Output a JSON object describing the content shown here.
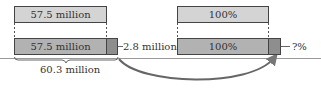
{
  "left": {
    "top_bar": {
      "label": "57.5 million"
    },
    "bottom_bar": {
      "label": "57.5 million"
    },
    "increment": {
      "label": "2.8 million"
    },
    "total": {
      "label": "60.3 million"
    }
  },
  "right": {
    "top_bar": {
      "label": "100%"
    },
    "bottom_bar": {
      "label": "100%"
    },
    "increment": {
      "label": "?%"
    }
  },
  "colors": {
    "original_bar": "#d4d4d4",
    "base_bar": "#b2b2b2",
    "increment_segment": "#8e8e8e",
    "outline": "#444444",
    "arrow": "#555555"
  }
}
